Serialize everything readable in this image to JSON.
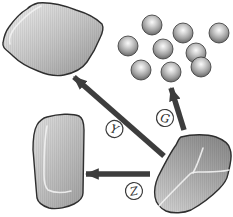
{
  "diagram": {
    "background": "#ffffff",
    "arrow_color": "#3d3d3d",
    "outline_color": "#2f2f2f",
    "shapes": {
      "fragment": {
        "name": "angular-rock-fragment",
        "fill_light": "#ececec",
        "fill_dark": "#989898"
      },
      "grains": {
        "name": "rounded-grain-cluster",
        "count": 9,
        "fill_highlight": "#fafafa",
        "fill_rim": "#565656"
      },
      "slab": {
        "name": "rounded-worn-slab",
        "fill_light": "#dedede",
        "fill_dark": "#a6a6a6"
      },
      "crystal": {
        "name": "large-faceted-crystal",
        "fill_light": "#cccccc",
        "fill_dark": "#8a8a8a"
      }
    },
    "arrows": [
      {
        "id": "crystal-to-fragment",
        "direction": "up-left",
        "label": "Y"
      },
      {
        "id": "crystal-to-grains",
        "direction": "up",
        "label": "G"
      },
      {
        "id": "crystal-to-slab",
        "direction": "left",
        "label": "Z"
      }
    ]
  }
}
